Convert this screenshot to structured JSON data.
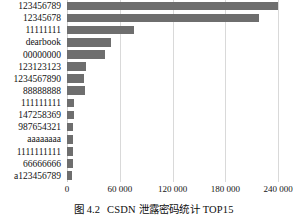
{
  "caption": {
    "number": "图 4.2",
    "text": "CSDN 泄露密码统计 TOP15"
  },
  "chart_data": {
    "type": "bar",
    "orientation": "horizontal",
    "title": "CSDN 泄露密码统计 TOP15",
    "xlabel": "",
    "ylabel": "",
    "xlim": [
      0,
      240000
    ],
    "xticks": [
      0,
      60000,
      120000,
      180000,
      240000
    ],
    "xticklabels": [
      "0",
      "60 000",
      "120 000",
      "180 000",
      "240 000"
    ],
    "grid": "vertical",
    "legend": "none",
    "bar_color": "#6e6e6e",
    "categories": [
      "123456789",
      "12345678",
      "11111111",
      "dearbook",
      "00000000",
      "123123123",
      "1234567890",
      "88888888",
      "111111111",
      "147258369",
      "987654321",
      "aaaaaaaa",
      "1111111111",
      "66666666",
      "a123456789"
    ],
    "values": [
      240000,
      218000,
      76000,
      50000,
      43000,
      22000,
      19000,
      20000,
      8000,
      7500,
      7200,
      7000,
      7000,
      6500,
      6000
    ]
  }
}
